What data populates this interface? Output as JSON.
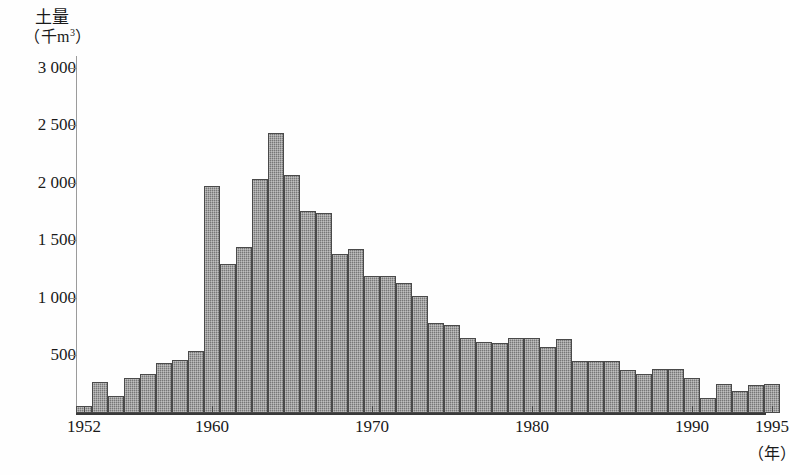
{
  "chart_data": {
    "type": "bar",
    "title": "",
    "ylabel": "土量",
    "yunit": "（千m³）",
    "ylabel_main": "土量",
    "xlabel": "（年）",
    "ylim": [
      0,
      3100
    ],
    "grid": false,
    "legend": false,
    "y_ticks": [
      3000,
      2500,
      2000,
      1500,
      1000,
      500
    ],
    "y_tick_labels": [
      "3 000",
      "2 500",
      "2 000",
      "1 500",
      "1 000",
      "500"
    ],
    "x_ticks": [
      1952,
      1960,
      1970,
      1980,
      1990,
      1995
    ],
    "x_tick_labels": [
      "1952",
      "1960",
      "1970",
      "1980",
      "1990",
      "1995"
    ],
    "categories": [
      1952,
      1953,
      1954,
      1955,
      1956,
      1957,
      1958,
      1959,
      1960,
      1961,
      1962,
      1963,
      1964,
      1965,
      1966,
      1967,
      1968,
      1969,
      1970,
      1971,
      1972,
      1973,
      1974,
      1975,
      1976,
      1977,
      1978,
      1979,
      1980,
      1981,
      1982,
      1983,
      1984,
      1985,
      1986,
      1987,
      1988,
      1989,
      1990,
      1991,
      1992,
      1993,
      1994,
      1995
    ],
    "values": [
      60,
      270,
      150,
      300,
      340,
      430,
      460,
      540,
      1970,
      1290,
      1440,
      2030,
      2430,
      2070,
      1750,
      1740,
      1380,
      1420,
      1190,
      1190,
      1130,
      1020,
      780,
      760,
      650,
      620,
      610,
      650,
      650,
      570,
      640,
      450,
      450,
      450,
      370,
      340,
      380,
      380,
      300,
      130,
      250,
      190,
      240,
      250
    ],
    "bar_color": "#848484",
    "bar_edge_color": "#4a4a4a",
    "axis_color": "#3a3a3a"
  }
}
